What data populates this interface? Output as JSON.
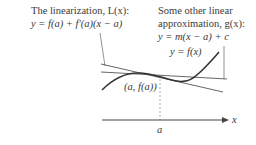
{
  "diagram": {
    "linearization_label": {
      "line1": "The linearization, L(x):",
      "line2": "y = f(a) + f′(a)(x − a)"
    },
    "other_label": {
      "line1": "Some other linear",
      "line2": "approximation, g(x):",
      "line3": "y = m(x − a) + c"
    },
    "curve_label": "y = f(x)",
    "point_label": "(a, f(a))",
    "axis_label": "x",
    "tick_label": "a",
    "colors": {
      "curve": "#333333",
      "lines": "#555555",
      "text": "#3a3a3a",
      "background": "#ffffff"
    }
  }
}
